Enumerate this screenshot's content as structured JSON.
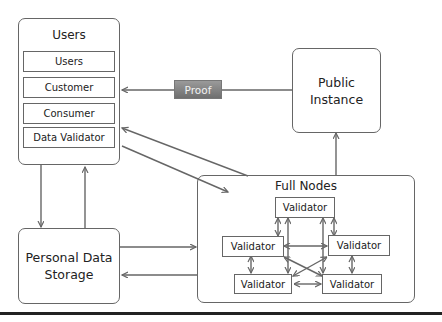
{
  "diagram": {
    "users_box": {
      "title": "Users",
      "items": [
        "Users",
        "Customer",
        "Consumer",
        "Data Validator"
      ]
    },
    "public_instance": {
      "label_line1": "Public",
      "label_line2": "Instance"
    },
    "personal_data_storage": {
      "label_line1": "Personal Data",
      "label_line2": "Storage"
    },
    "full_nodes": {
      "title": "Full Nodes",
      "validators": [
        "Validator",
        "Validator",
        "Validator",
        "Validator",
        "Validator"
      ]
    },
    "edges": {
      "proof_label": "Proof"
    },
    "colors": {
      "line": "#666666",
      "proof_fill": "#808080",
      "proof_text": "#f2f2f2"
    }
  }
}
